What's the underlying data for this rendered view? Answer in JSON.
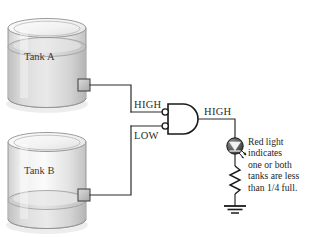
{
  "figure": {
    "type": "logic-diagram"
  },
  "tanks": [
    {
      "id": "tank-a",
      "label": "Tank A",
      "level_state": "above one quarter",
      "fill_fraction": 0.72,
      "sensor_output": "HIGH"
    },
    {
      "id": "tank-b",
      "label": "Tank B",
      "level_state": "below one quarter",
      "fill_fraction": 0.12,
      "sensor_output": "LOW"
    }
  ],
  "signals": {
    "input_a": "HIGH",
    "input_b": "LOW",
    "output": "HIGH"
  },
  "gate": {
    "name": "negative-AND gate",
    "inverted_inputs": true,
    "input_count": 2
  },
  "indicator": {
    "name": "led",
    "caption_lines": [
      "Red light",
      "indicates",
      "one or both",
      "tanks are less",
      "than 1/4 full."
    ],
    "components": [
      "led",
      "resistor",
      "ground"
    ]
  },
  "colors": {
    "wire": "#2b2b2b",
    "tank_outline": "#8a8a8a",
    "tank_body": "#e9e9e9",
    "liquid": "#cfcfcf",
    "sensor_box": "#b9b9b9",
    "text": "#262626",
    "led_body": "#4a4a4a"
  }
}
